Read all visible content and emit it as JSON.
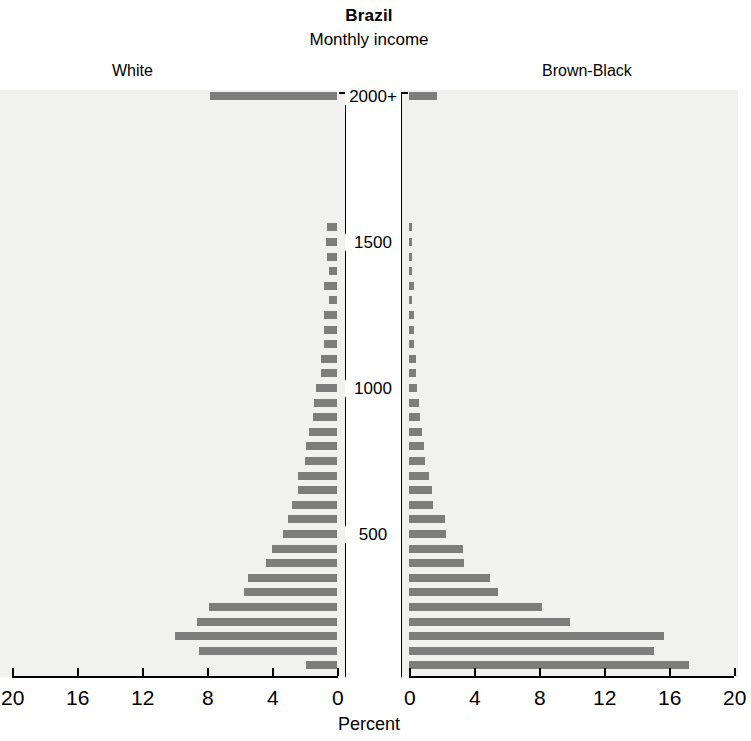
{
  "header": {
    "title": "Brazil",
    "subtitle": "Monthly income"
  },
  "panels": {
    "left_label": "White",
    "right_label": "Brown-Black"
  },
  "axis": {
    "title": "Percent",
    "left_ticks": [
      "20",
      "16",
      "12",
      "8",
      "4",
      "0"
    ],
    "right_ticks": [
      "0",
      "4",
      "8",
      "12",
      "16",
      "20"
    ]
  },
  "center_labels": [
    "2000+",
    "1500",
    "1000",
    "500"
  ],
  "colors": {
    "bar": "#7d7d7d",
    "panel_background": "#f1f1f0",
    "center_background": "#ffffff",
    "axis": "#000000"
  },
  "chart_data": {
    "type": "bar",
    "title": "Brazil",
    "subtitle": "Monthly income",
    "xlabel": "Percent",
    "ylabel": "Monthly income",
    "xlim": [
      0,
      20
    ],
    "grid": false,
    "orientation": "horizontal",
    "layout": "population-pyramid",
    "legend_position": "above-panels",
    "categories": [
      "2000+",
      "1950",
      "1900",
      "1850",
      "1800",
      "1750",
      "1700",
      "1650",
      "1600",
      "1550",
      "1500",
      "1450",
      "1400",
      "1350",
      "1300",
      "1250",
      "1200",
      "1150",
      "1100",
      "1050",
      "1000",
      "950",
      "900",
      "850",
      "800",
      "750",
      "700",
      "650",
      "600",
      "550",
      "500",
      "450",
      "400",
      "350",
      "300",
      "250",
      "200",
      "150",
      "100",
      "50"
    ],
    "series": [
      {
        "name": "White",
        "side": "left",
        "values": [
          7.8,
          0.0,
          0.0,
          0.0,
          0.0,
          0.0,
          0.0,
          0.0,
          0.0,
          0.6,
          0.7,
          0.6,
          0.5,
          0.8,
          0.5,
          0.8,
          0.8,
          0.8,
          1.0,
          1.0,
          1.3,
          1.4,
          1.5,
          1.7,
          1.9,
          2.0,
          2.4,
          2.4,
          2.8,
          3.0,
          3.3,
          4.0,
          4.4,
          5.5,
          5.7,
          7.9,
          8.6,
          10.0,
          8.5,
          1.9
        ]
      },
      {
        "name": "Brown-Black",
        "side": "right",
        "values": [
          1.7,
          0.0,
          0.0,
          0.0,
          0.0,
          0.0,
          0.0,
          0.0,
          0.0,
          0.2,
          0.2,
          0.2,
          0.2,
          0.3,
          0.2,
          0.3,
          0.3,
          0.3,
          0.4,
          0.4,
          0.5,
          0.6,
          0.7,
          0.8,
          0.9,
          1.0,
          1.2,
          1.4,
          1.5,
          2.2,
          2.3,
          3.3,
          3.4,
          5.0,
          5.5,
          8.2,
          9.9,
          15.7,
          15.1,
          17.2
        ]
      }
    ]
  },
  "geometry": {
    "plot_top": 92,
    "row_spacing": 14.6,
    "bar_height": 8,
    "left_zero_x": 337,
    "right_zero_x": 409,
    "px_per_unit": 16.25,
    "center_label_rows": {
      "2000+": 0,
      "1500": 10,
      "1000": 20,
      "500": 30
    }
  }
}
